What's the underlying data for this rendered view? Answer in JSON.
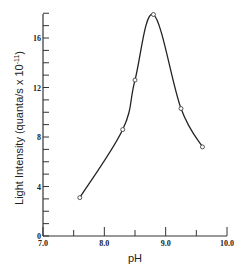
{
  "chart_data": {
    "type": "line",
    "title": "",
    "xlabel": "pH",
    "ylabel": "Light Intensity (quanta/s x 10^-11)",
    "ylabel_main": "Light Intensity (quanta/s x 10",
    "ylabel_exp": "-11",
    "ylabel_close": ")",
    "xlim": [
      7.0,
      10.0
    ],
    "ylim": [
      0,
      18
    ],
    "x_ticks": [
      "7.0",
      "8.0",
      "9.0",
      "10.0"
    ],
    "y_ticks": [
      "0",
      "4",
      "8",
      "12",
      "16"
    ],
    "grid": false,
    "legend": null,
    "series": [
      {
        "name": "Light Intensity",
        "marker": "open-circle",
        "smooth": true,
        "x": [
          7.6,
          8.3,
          8.5,
          8.8,
          9.25,
          9.6
        ],
        "y": [
          3.1,
          8.6,
          12.6,
          17.9,
          10.3,
          7.2
        ]
      }
    ]
  }
}
